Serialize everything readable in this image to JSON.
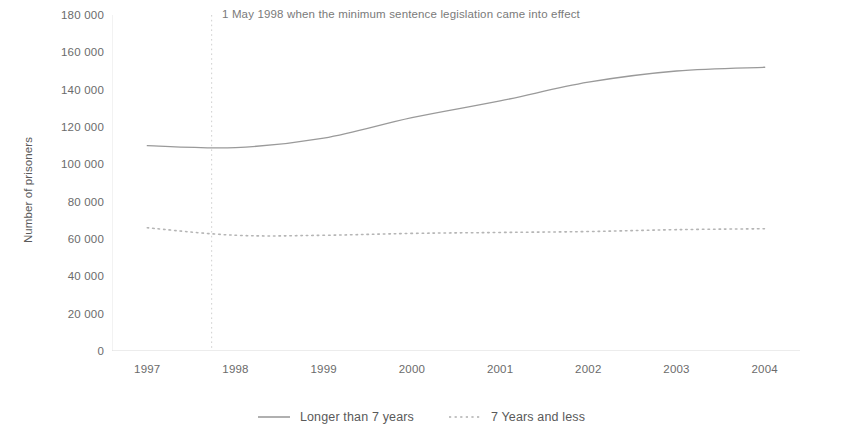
{
  "chart_data": {
    "type": "line",
    "title": "",
    "subtitle": "",
    "xlabel": "",
    "ylabel": "Number of prisoners",
    "categories": [
      "1997",
      "1998",
      "1999",
      "2000",
      "2001",
      "2002",
      "2003",
      "2004"
    ],
    "x": [
      1997,
      1998,
      1999,
      2000,
      2001,
      2002,
      2003,
      2004
    ],
    "ylim": [
      0,
      180000
    ],
    "xlim": [
      1996.6,
      2004.4
    ],
    "y_ticks": [
      0,
      20000,
      40000,
      60000,
      80000,
      100000,
      120000,
      140000,
      160000,
      180000
    ],
    "y_tick_labels": [
      "0",
      "20 000",
      "40 000",
      "60 000",
      "80 000",
      "100 000",
      "120 000",
      "140 000",
      "160 000",
      "180 000"
    ],
    "grid": false,
    "legend_position": "bottom-center",
    "series": [
      {
        "name": "Longer than 7 years",
        "style": "solid",
        "color": "#9a9a9a",
        "values": [
          110000,
          109000,
          114000,
          125000,
          134000,
          144000,
          150000,
          152000
        ]
      },
      {
        "name": "7 Years and less",
        "style": "dotted",
        "color": "#b5b5b5",
        "values": [
          66000,
          62000,
          62000,
          63000,
          63500,
          64000,
          65000,
          65500
        ]
      }
    ],
    "annotations": [
      {
        "text": "1 May 1998 when the minimum sentence legislation came into effect",
        "marker": "vertical-dotted-line",
        "x_value": 1997.73,
        "color": "#7a7a7a"
      }
    ]
  },
  "legend": {
    "entries": [
      {
        "label": "Longer than 7 years",
        "swatch": "solid-line-swatch"
      },
      {
        "label": "7 Years and less",
        "swatch": "dotted-line-swatch"
      }
    ]
  },
  "axis": {
    "y_title": "Number of prisoners"
  },
  "colors": {
    "series_1": "#9a9a9a",
    "series_2": "#b5b5b5",
    "axis": "#dcdcdc",
    "tick_text": "#6b6b6b",
    "annotation_text": "#7a7a7a",
    "background": "#ffffff"
  }
}
